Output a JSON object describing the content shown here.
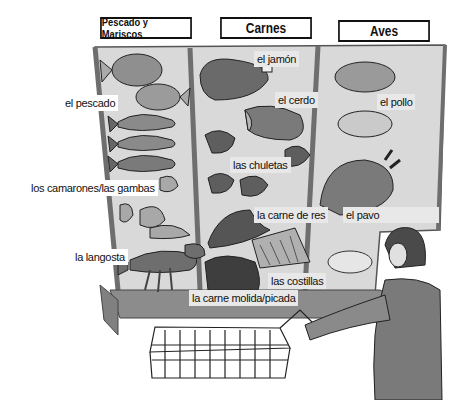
{
  "sections": {
    "seafood": {
      "title": "Pescado y Mariscos"
    },
    "meats": {
      "title": "Carnes"
    },
    "poultry": {
      "title": "Aves"
    }
  },
  "labels": {
    "fish": "el pescado",
    "shrimp": "los camarones/las gambas",
    "lobster": "la langosta",
    "ham": "el jamón",
    "pork": "el cerdo",
    "chops": "las chuletas",
    "beef": "la carne de res",
    "ribs": "las costillas",
    "ground_meat": "la carne molida/picada",
    "chicken": "el pollo",
    "turkey": "el pavo"
  },
  "colors": {
    "case_fill": "#d6d6d6",
    "case_frame": "#7a7a7a",
    "food_dark": "#5a5a5a",
    "food_mid": "#8a8a8a",
    "food_light": "#c4c4c4",
    "outline": "#222222"
  }
}
